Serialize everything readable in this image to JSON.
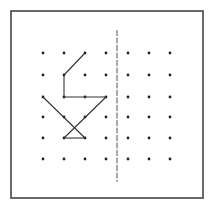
{
  "figure": {
    "frame": {
      "x": 11,
      "y": 11,
      "width": 192,
      "height": 187,
      "stroke": "#444444"
    },
    "grid": {
      "columns_x": [
        43,
        64,
        85,
        106,
        128,
        149,
        170
      ],
      "rows_y": [
        53,
        75,
        97,
        117,
        138,
        159
      ],
      "dot_color": "#222222",
      "dot_radius": 1.4
    },
    "mirror_line": {
      "x": 117,
      "y1": 30,
      "y2": 182,
      "stroke": "#555555",
      "style": "dashed"
    },
    "segments": [
      {
        "from": [
          2,
          0
        ],
        "to": [
          1,
          1
        ]
      },
      {
        "from": [
          1,
          1
        ],
        "to": [
          1,
          2
        ]
      },
      {
        "from": [
          1,
          2
        ],
        "to": [
          3,
          2
        ]
      },
      {
        "from": [
          0,
          2
        ],
        "to": [
          2,
          4
        ]
      },
      {
        "from": [
          3,
          2
        ],
        "to": [
          1,
          4
        ]
      },
      {
        "from": [
          1,
          4
        ],
        "to": [
          2,
          4
        ]
      }
    ],
    "line_color": "#333333"
  }
}
